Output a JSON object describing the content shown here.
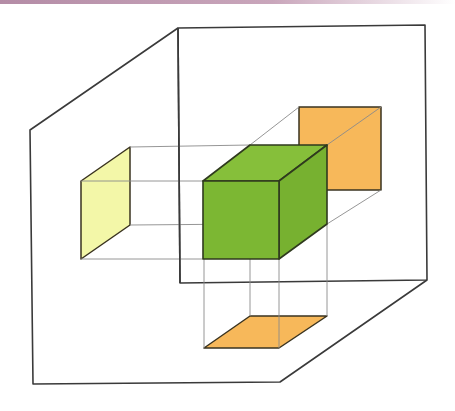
{
  "diagram": {
    "title": "Orthographic projection of a cube onto three planes",
    "colors": {
      "banner_start": "#b48ca6",
      "banner_end": "#ffffff",
      "frame_stroke": "#3a3a3a",
      "projection_line": "#8a8a8a",
      "cube_front": "#7cb733",
      "cube_top": "#86bf3a",
      "cube_side": "#77b130",
      "side_projection": "#f3f7a8",
      "back_projection": "#f7b85a",
      "bottom_projection": "#f7b85a"
    },
    "elements": {
      "cube": "Green cube (3D object)",
      "side_plane_projection": "Pale yellow parallelogram on left plane",
      "back_plane_projection": "Orange square on back plane",
      "bottom_plane_projection": "Orange parallelogram on floor plane",
      "projection_lines": "Thin gray projection lines connecting cube vertices to projections",
      "front_frame": "Outer oblique frame (left wall / floor)",
      "back_frame": "Back rectangular plane"
    }
  }
}
